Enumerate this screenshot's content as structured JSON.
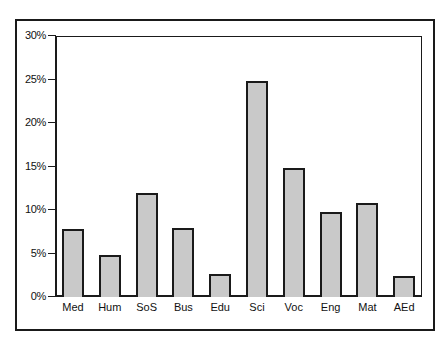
{
  "chart_data": {
    "type": "bar",
    "title": "",
    "xlabel": "",
    "ylabel": "",
    "categories": [
      "Med",
      "Hum",
      "SoS",
      "Bus",
      "Edu",
      "Sci",
      "Voc",
      "Eng",
      "Mat",
      "AEd"
    ],
    "values": [
      7.8,
      4.8,
      12.0,
      7.9,
      2.6,
      24.8,
      14.8,
      9.8,
      10.8,
      2.4
    ],
    "value_unit": "%",
    "ylim": [
      0,
      30
    ],
    "yticks": [
      0,
      5,
      10,
      15,
      20,
      25,
      30
    ],
    "ytick_labels": [
      "0%",
      "5%",
      "10%",
      "15%",
      "20%",
      "25%",
      "30%"
    ],
    "grid": false,
    "legend": null,
    "bar_fill": "#c9c9c9",
    "bar_edge": "#1a1a1a"
  }
}
